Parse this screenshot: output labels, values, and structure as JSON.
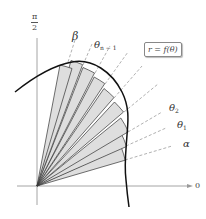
{
  "figure": {
    "axis_labels": {
      "polar_axis": "0",
      "vertical_num": "π",
      "vertical_den": "2"
    },
    "equation_label": "r = f(θ)",
    "ray_labels": {
      "alpha": "α",
      "theta1": "θ",
      "theta1_sub": "1",
      "theta2": "θ",
      "theta2_sub": "2",
      "theta_n_minus_1": "θ",
      "theta_n_minus_1_sub": "n − 1",
      "beta": "β"
    },
    "colors": {
      "sector_fill": "#dcdcdc",
      "sector_stroke": "#333333",
      "curve": "#111111",
      "axis": "#999999",
      "dashed": "#aaaaaa"
    },
    "sector_count": 9
  }
}
